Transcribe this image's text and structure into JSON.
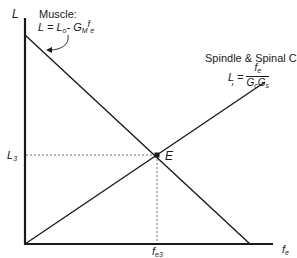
{
  "axes": {
    "y_label": "L",
    "x_label": "f",
    "x_label_sub": "e"
  },
  "muscle": {
    "title": "Muscle:",
    "formula_lhs": "L = L",
    "formula_lhs_sub": "o",
    "formula_mid": "- G",
    "formula_mid_sub": "M",
    "formula_f": "f",
    "formula_f_sub": "e"
  },
  "spindle": {
    "title": "Spindle & Spinal Cord",
    "formula_lhs": "L =",
    "num": "f",
    "num_sub": "e",
    "den_g1": "G",
    "den_g1_sub": "c",
    "den_g2": "G",
    "den_g2_sub": "s"
  },
  "equilibrium": {
    "point_label": "E",
    "y_tick": "L",
    "y_tick_sub": "3",
    "x_tick": "f",
    "x_tick_sub": "e3"
  },
  "colors": {
    "line": "#1a1a1a",
    "dashed": "#555555"
  }
}
